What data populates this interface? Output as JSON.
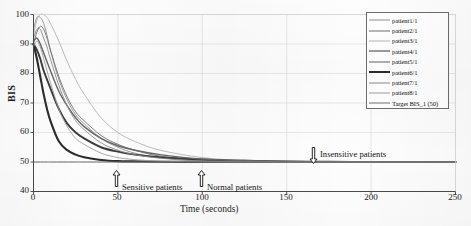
{
  "chart_data": {
    "type": "line",
    "title": "",
    "xlabel": "Time (seconds)",
    "ylabel": "BIS",
    "xlim": [
      0,
      250
    ],
    "ylim": [
      40,
      100
    ],
    "xticks": [
      0,
      50,
      100,
      150,
      200,
      250
    ],
    "yticks": [
      40,
      50,
      60,
      70,
      80,
      90,
      100
    ],
    "grid": true,
    "legend_position": "top-right",
    "x": [
      0,
      2,
      4,
      6,
      8,
      10,
      15,
      20,
      25,
      30,
      40,
      50,
      60,
      75,
      100,
      125,
      150,
      175,
      200,
      225,
      250
    ],
    "series": [
      {
        "name": "patient1/1",
        "color": "#8f8f8f",
        "width": 0.9,
        "values": [
          95,
          99,
          99,
          97,
          93,
          88,
          78,
          71,
          66,
          63,
          58,
          55,
          53,
          51.5,
          50.4,
          50.1,
          50,
          50,
          50,
          50,
          50
        ]
      },
      {
        "name": "patient2/1",
        "color": "#707070",
        "width": 0.9,
        "values": [
          90,
          94,
          96,
          95,
          92,
          88,
          79,
          72,
          67,
          64,
          59,
          56,
          54,
          52,
          50.6,
          50.2,
          50.1,
          50,
          50,
          50,
          50
        ]
      },
      {
        "name": "patient3/1",
        "color": "#b4b4b4",
        "width": 0.9,
        "values": [
          93,
          98,
          100,
          100,
          99,
          97,
          91,
          84,
          78,
          73,
          65,
          60,
          57,
          54,
          51.5,
          50.5,
          50.2,
          50.1,
          50,
          50,
          50
        ]
      },
      {
        "name": "patient4/1",
        "color": "#3a3a3a",
        "width": 1.9,
        "values": [
          90,
          88,
          85,
          81,
          78,
          75,
          68,
          63,
          60,
          58,
          55,
          53.5,
          52.5,
          51.6,
          50.8,
          50.4,
          50.2,
          50.1,
          50,
          50,
          50
        ]
      },
      {
        "name": "patient5/1",
        "color": "#656565",
        "width": 1.4,
        "values": [
          91,
          92,
          90,
          87,
          84,
          81,
          74,
          69,
          65,
          62,
          58,
          55.5,
          54,
          52.5,
          51,
          50.5,
          50.2,
          50.1,
          50,
          50,
          50
        ]
      },
      {
        "name": "patient6/1",
        "color": "#2b2b2b",
        "width": 2.1,
        "values": [
          90,
          85,
          79,
          73,
          68,
          64,
          57,
          54,
          52.5,
          51.6,
          50.7,
          50.3,
          50.2,
          50.1,
          50,
          50,
          50,
          50,
          50,
          50,
          50
        ]
      },
      {
        "name": "patient7/1",
        "color": "#8a8a8a",
        "width": 0.9,
        "values": [
          92,
          95,
          95,
          92,
          89,
          85,
          76,
          69,
          64,
          61,
          56.5,
          54,
          52.5,
          51.3,
          50.3,
          50.1,
          50,
          50,
          50,
          50,
          50
        ]
      },
      {
        "name": "patient8/1",
        "color": "#a0a0a0",
        "width": 0.9,
        "values": [
          89,
          91,
          89,
          85,
          81,
          77,
          68,
          62,
          58,
          56,
          53,
          51.5,
          50.8,
          50.3,
          50.05,
          50,
          50,
          50,
          50,
          50,
          50
        ]
      },
      {
        "name": "Target BIS_1 (50)",
        "color": "#707070",
        "width": 1.0,
        "values": [
          50,
          50,
          50,
          50,
          50,
          50,
          50,
          50,
          50,
          50,
          50,
          50,
          50,
          50,
          50,
          50,
          50,
          50,
          50,
          50,
          50
        ]
      }
    ],
    "annotations": [
      {
        "text": "Sensitive patients",
        "arrow": "up",
        "x": 50,
        "y": 40
      },
      {
        "text": "Normal patients",
        "arrow": "up",
        "x": 100,
        "y": 40
      },
      {
        "text": "Insensitive patients",
        "arrow": "down",
        "x": 172,
        "y": 53
      }
    ]
  },
  "axes": {
    "ylabel": "BIS",
    "xlabel": "Time (seconds)",
    "yticks": [
      "100",
      "90",
      "80",
      "70",
      "60",
      "50",
      "40"
    ],
    "xticks": [
      "0",
      "50",
      "100",
      "150",
      "200",
      "250"
    ]
  },
  "legend": {
    "items": [
      "patient1/1",
      "patient2/1",
      "patient3/1",
      "patient4/1",
      "patient5/1",
      "patient6/1",
      "patient7/1",
      "patient8/1",
      "Target BIS_1 (50)"
    ]
  },
  "annotations": {
    "sensitive": "Sensitive patients",
    "normal": "Normal patients",
    "insensitive": "Insensitive patients"
  }
}
